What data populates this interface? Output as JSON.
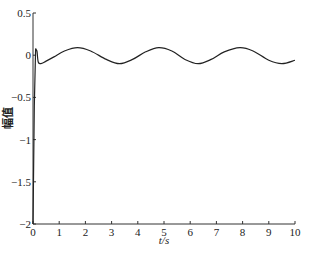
{
  "chart_data": {
    "type": "line",
    "title": "",
    "xlabel": "t/s",
    "ylabel": "幅值",
    "xlim": [
      0,
      10
    ],
    "ylim": [
      -2,
      0.5
    ],
    "grid": false,
    "legend": null,
    "xticks": [
      "0",
      "1",
      "2",
      "3",
      "4",
      "5",
      "6",
      "7",
      "8",
      "9",
      "10"
    ],
    "yticks": [
      "0.5",
      "0",
      "-0.5",
      "-1",
      "-1.5",
      "-2"
    ],
    "series": [
      {
        "name": "response",
        "color": "#222222",
        "x": [
          0,
          0.05,
          0.1,
          0.15,
          0.2,
          0.3,
          0.5,
          0.8,
          1.2,
          1.7,
          2.2,
          2.8,
          3.3,
          3.8,
          4.3,
          4.8,
          5.3,
          5.8,
          6.3,
          6.8,
          7.3,
          7.9,
          8.4,
          9.0,
          9.5,
          10.0
        ],
        "y": [
          -2.0,
          -0.6,
          0.08,
          0.05,
          -0.08,
          -0.1,
          -0.07,
          -0.02,
          0.05,
          0.09,
          0.05,
          -0.05,
          -0.1,
          -0.05,
          0.04,
          0.09,
          0.05,
          -0.05,
          -0.1,
          -0.05,
          0.04,
          0.09,
          0.05,
          -0.06,
          -0.1,
          -0.06
        ]
      }
    ]
  }
}
